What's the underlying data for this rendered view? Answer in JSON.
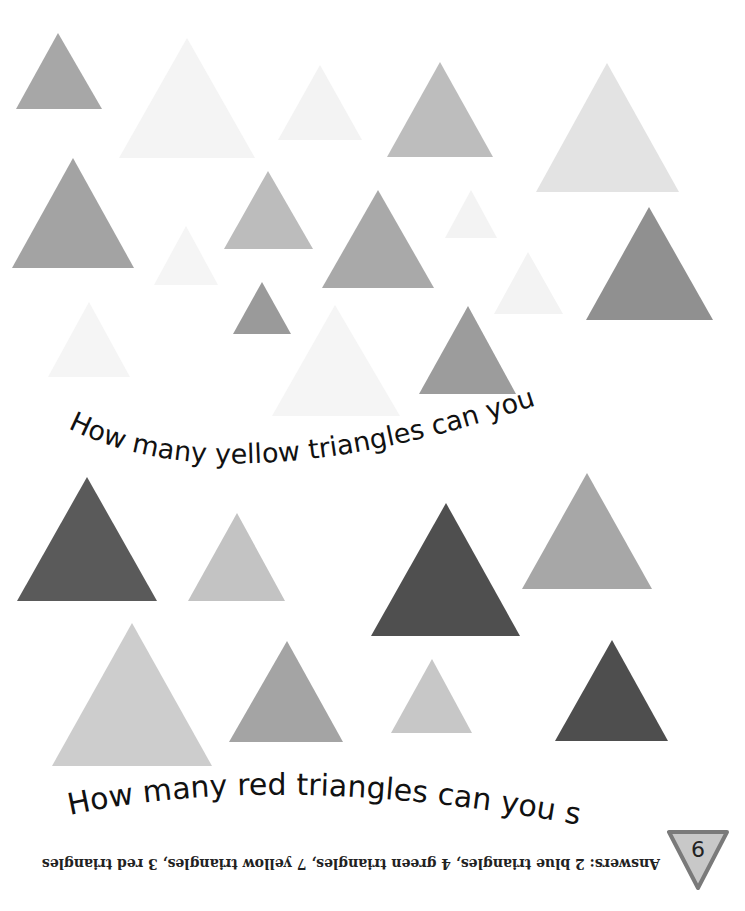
{
  "page": {
    "questions": {
      "yellow": "How many yellow triangles can you see?",
      "red": "How many red triangles can you see?"
    },
    "answers": "Answers: 2 blue triangles, 4 green triangles, 7 yellow triangles, 3 red triangles",
    "page_number": "9",
    "colors": {
      "background": "#ffffff",
      "text": "#111111",
      "badge_fill": "#c8c8c8",
      "badge_border": "#7a7a7a"
    },
    "triangles_top": [
      {
        "id": "t1",
        "points": "58,33 102,109 16,109",
        "fill": "#a7a7a7"
      },
      {
        "id": "t2",
        "points": "187,38 255,158 119,158",
        "fill": "#f4f4f4"
      },
      {
        "id": "t3",
        "points": "320,65 362,140 278,140",
        "fill": "#f3f3f3"
      },
      {
        "id": "t4",
        "points": "440,62 493,157 387,157",
        "fill": "#bdbdbd"
      },
      {
        "id": "t5",
        "points": "607,63 679,192 536,192",
        "fill": "#e3e3e3"
      },
      {
        "id": "t6",
        "points": "73,158 134,268 12,268",
        "fill": "#a3a3a3"
      },
      {
        "id": "t7",
        "points": "268,171 313,249 224,249",
        "fill": "#bcbcbc"
      },
      {
        "id": "t8",
        "points": "378,190 434,288 322,288",
        "fill": "#a9a9a9"
      },
      {
        "id": "t9",
        "points": "471,190 497,238 445,238",
        "fill": "#f3f3f3"
      },
      {
        "id": "t10",
        "points": "186,226 218,285 154,285",
        "fill": "#f5f5f5"
      },
      {
        "id": "t11",
        "points": "649,207 713,320 586,320",
        "fill": "#909090"
      },
      {
        "id": "t12",
        "points": "528,252 563,314 494,314",
        "fill": "#f3f3f3"
      },
      {
        "id": "t13",
        "points": "262,282 291,334 233,334",
        "fill": "#9a9a9a"
      },
      {
        "id": "t14",
        "points": "89,302 130,377 48,377",
        "fill": "#f5f5f5"
      },
      {
        "id": "t15",
        "points": "335,305 400,416 272,416",
        "fill": "#f5f5f5"
      },
      {
        "id": "t16",
        "points": "468,306 516,394 419,394",
        "fill": "#9c9c9c"
      }
    ],
    "triangles_bottom": [
      {
        "id": "b1",
        "points": "87,477 157,601 17,601",
        "fill": "#5a5a5a"
      },
      {
        "id": "b2",
        "points": "237,513 285,601 188,601",
        "fill": "#c3c3c3"
      },
      {
        "id": "b3",
        "points": "446,503 520,636 371,636",
        "fill": "#4f4f4f"
      },
      {
        "id": "b4",
        "points": "587,473 652,589 522,589",
        "fill": "#a7a7a7"
      },
      {
        "id": "b5",
        "points": "132,623 212,766 52,766",
        "fill": "#cdcdcd"
      },
      {
        "id": "b6",
        "points": "287,641 343,742 229,742",
        "fill": "#a4a4a4"
      },
      {
        "id": "b7",
        "points": "432,659 472,733 391,733",
        "fill": "#c7c7c7"
      },
      {
        "id": "b8",
        "points": "612,640 668,741 555,741",
        "fill": "#4e4e4e"
      }
    ]
  }
}
